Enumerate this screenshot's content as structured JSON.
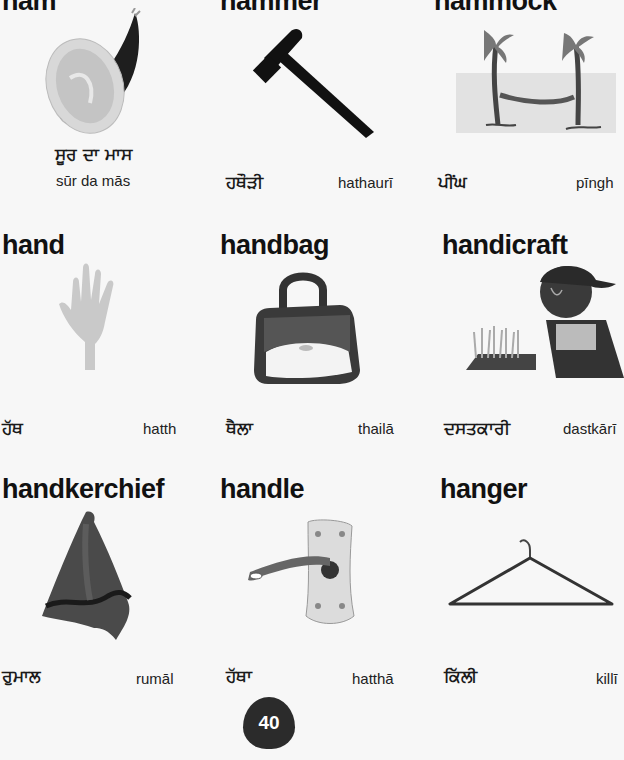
{
  "page": {
    "number": "40"
  },
  "entries": [
    {
      "word": "ham",
      "native": "ਸੂਰ ਦਾ ਮਾਸ",
      "translit": "sūr da mās",
      "icon": "ham-icon"
    },
    {
      "word": "hammer",
      "native": "ਹਥੌੜੀ",
      "translit": "hathaurī",
      "icon": "hammer-icon"
    },
    {
      "word": "hammock",
      "native": "ਪੀਂਘ",
      "translit": "pīngh",
      "icon": "hammock-icon"
    },
    {
      "word": "hand",
      "native": "ਹੱਥ",
      "translit": "hatth",
      "icon": "hand-icon"
    },
    {
      "word": "handbag",
      "native": "ਥੈਲਾ",
      "translit": "thailā",
      "icon": "handbag-icon"
    },
    {
      "word": "handicraft",
      "native": "ਦਸਤਕਾਰੀ",
      "translit": "dastkārī",
      "icon": "handicraft-icon"
    },
    {
      "word": "handkerchief",
      "native": "ਰੁਮਾਲ",
      "translit": "rumāl",
      "icon": "handkerchief-icon"
    },
    {
      "word": "handle",
      "native": "ਹੱਥਾ",
      "translit": "hatthā",
      "icon": "handle-icon"
    },
    {
      "word": "hanger",
      "native": "ਕਿੱਲੀ",
      "translit": "killī",
      "icon": "hanger-icon"
    }
  ]
}
